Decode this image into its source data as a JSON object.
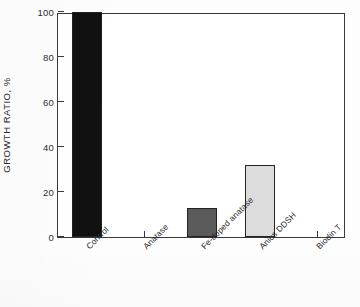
{
  "chart_data": {
    "type": "bar",
    "title": "",
    "xlabel": "",
    "ylabel": "GROWTH RATIO, %",
    "ylim": [
      0,
      100
    ],
    "ytick_labels": [
      "0",
      "20",
      "40",
      "60",
      "80",
      "100"
    ],
    "ytick_values": [
      0,
      20,
      40,
      60,
      80,
      100
    ],
    "grid": false,
    "legend": "none",
    "categories": [
      "Control",
      "Anatase",
      "Fe-doped anatase",
      "Anios DDSH",
      "Biodin T"
    ],
    "values": [
      100,
      0,
      13,
      32,
      0
    ],
    "bar_colors": [
      "#111111",
      "#ffffff",
      "#5a5a5a",
      "#dcdcdc",
      "#ffffff"
    ],
    "bar_edge_color": "#222222"
  }
}
